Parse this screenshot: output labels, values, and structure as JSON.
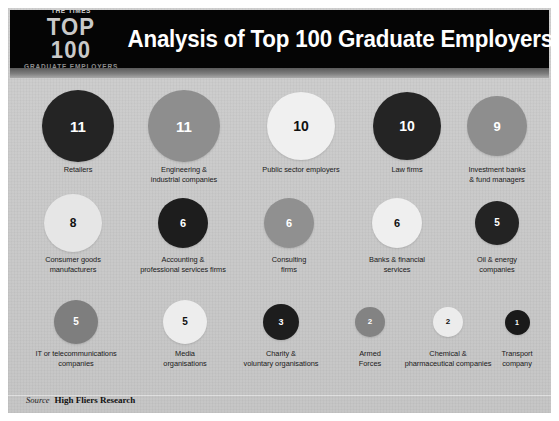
{
  "header": {
    "logo_top": "THE TIMES",
    "logo_mid": "TOP 100",
    "logo_bottom": "GRADUATE EMPLOYERS",
    "title": "Analysis of Top 100 Graduate Employers in 2015",
    "background_color": "#050505",
    "title_color": "#ffffff"
  },
  "footer": {
    "source_label": "Source",
    "source_name": "High Fliers Research"
  },
  "chart_data": {
    "type": "bar",
    "title": "Analysis of Top 100 Graduate Employers in 2015",
    "xlabel": "",
    "ylabel": "Number of employers",
    "categories": [
      "Retailers",
      "Engineering & industrial companies",
      "Public sector employers",
      "Law firms",
      "Investment banks & fund managers",
      "Consumer goods manufacturers",
      "Accounting & professional services firms",
      "Consulting firms",
      "Banks & financial services",
      "Oil & energy companies",
      "IT or telecommunications companies",
      "Media organisations",
      "Charity & voluntary organisations",
      "Armed Forces",
      "Chemical & pharmaceutical companies",
      "Transport company"
    ],
    "values": [
      11,
      11,
      10,
      10,
      9,
      8,
      6,
      6,
      6,
      5,
      5,
      5,
      3,
      2,
      2,
      1
    ],
    "total": 100,
    "ylim": [
      0,
      11
    ],
    "grid": false,
    "legend": false
  },
  "bubbles": [
    {
      "label": "Retailers",
      "value": "11",
      "fill": "#242424",
      "text": "#ffffff",
      "size": 72,
      "num": 15,
      "row": 0,
      "cx": 70,
      "lw": 96
    },
    {
      "label": "Engineering &\nindustrial companies",
      "value": "11",
      "fill": "#8e8e8e",
      "text": "#ffffff",
      "size": 72,
      "num": 15,
      "row": 0,
      "cx": 176,
      "lw": 104
    },
    {
      "label": "Public sector employers",
      "value": "10",
      "fill": "#f0f0f0",
      "text": "#111111",
      "size": 68,
      "num": 14,
      "row": 0,
      "cx": 293,
      "lw": 112
    },
    {
      "label": "Law firms",
      "value": "10",
      "fill": "#242424",
      "text": "#ffffff",
      "size": 68,
      "num": 14,
      "row": 0,
      "cx": 399,
      "lw": 90
    },
    {
      "label": "Investment banks\n& fund managers",
      "value": "9",
      "fill": "#8e8e8e",
      "text": "#ffffff",
      "size": 60,
      "num": 13,
      "row": 0,
      "cx": 489,
      "lw": 98
    },
    {
      "label": "Consumer goods\nmanufacturers",
      "value": "8",
      "fill": "#e6e6e6",
      "text": "#111111",
      "size": 58,
      "num": 12,
      "row": 1,
      "cx": 65,
      "lw": 98
    },
    {
      "label": "Accounting &\nprofessional services firms",
      "value": "6",
      "fill": "#1d1d1d",
      "text": "#ffffff",
      "size": 50,
      "num": 11,
      "row": 1,
      "cx": 175,
      "lw": 120
    },
    {
      "label": "Consulting\nfirms",
      "value": "6",
      "fill": "#909090",
      "text": "#ffffff",
      "size": 50,
      "num": 11,
      "row": 1,
      "cx": 281,
      "lw": 80
    },
    {
      "label": "Banks & financial\nservices",
      "value": "6",
      "fill": "#efefef",
      "text": "#111111",
      "size": 50,
      "num": 11,
      "row": 1,
      "cx": 389,
      "lw": 96
    },
    {
      "label": "Oil & energy\ncompanies",
      "value": "5",
      "fill": "#232323",
      "text": "#ffffff",
      "size": 44,
      "num": 10,
      "row": 1,
      "cx": 489,
      "lw": 84
    },
    {
      "label": "IT or telecommunications\ncompanies",
      "value": "5",
      "fill": "#7e7e7e",
      "text": "#ffffff",
      "size": 44,
      "num": 10,
      "row": 2,
      "cx": 68,
      "lw": 118
    },
    {
      "label": "Media\norganisations",
      "value": "5",
      "fill": "#ededed",
      "text": "#111111",
      "size": 44,
      "num": 10,
      "row": 2,
      "cx": 177,
      "lw": 86
    },
    {
      "label": "Charity &\nvoluntary organisations",
      "value": "3",
      "fill": "#1d1d1d",
      "text": "#ffffff",
      "size": 36,
      "num": 9,
      "row": 2,
      "cx": 273,
      "lw": 114
    },
    {
      "label": "Armed\nForces",
      "value": "2",
      "fill": "#838383",
      "text": "#ffffff",
      "size": 30,
      "num": 8,
      "row": 2,
      "cx": 362,
      "lw": 64
    },
    {
      "label": "Chemical &\npharmaceutical companies",
      "value": "2",
      "fill": "#ececec",
      "text": "#111111",
      "size": 30,
      "num": 8,
      "row": 2,
      "cx": 440,
      "lw": 118
    },
    {
      "label": "Transport\ncompany",
      "value": "1",
      "fill": "#1a1a1a",
      "text": "#ffffff",
      "size": 25,
      "num": 7,
      "row": 2,
      "cx": 509,
      "lw": 62
    }
  ],
  "layout": {
    "row_tops": [
      8,
      112,
      216
    ]
  }
}
